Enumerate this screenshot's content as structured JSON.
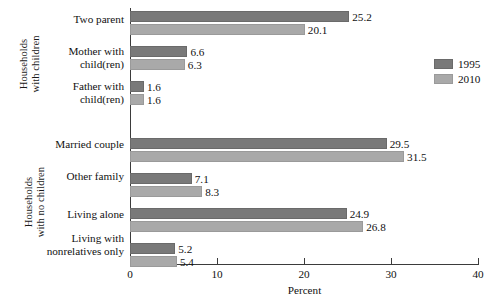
{
  "chart_data": {
    "type": "bar",
    "orientation": "horizontal",
    "title": "",
    "xlabel": "Percent",
    "ylabel": "",
    "xlim": [
      0,
      40
    ],
    "xticks": [
      0,
      10,
      20,
      30,
      40
    ],
    "xtick_labels": [
      "0",
      "10",
      "20",
      "30",
      "40"
    ],
    "grid": false,
    "legend_position": "right",
    "series": [
      {
        "name": "1995",
        "color": "#797979",
        "values": [
          25.2,
          6.6,
          1.6,
          29.5,
          7.1,
          24.9,
          5.2
        ]
      },
      {
        "name": "2010",
        "color": "#a9a9a9",
        "values": [
          20.1,
          6.3,
          1.6,
          31.5,
          8.3,
          26.8,
          5.4
        ]
      }
    ],
    "categories": [
      "Two parent",
      "Mother with child(ren)",
      "Father with child(ren)",
      "Married couple",
      "Other family",
      "Living alone",
      "Living with nonrelatives only"
    ],
    "category_lines": [
      [
        "Two parent"
      ],
      [
        "Mother with",
        "child(ren)"
      ],
      [
        "Father with",
        "child(ren)"
      ],
      [
        "Married couple"
      ],
      [
        "Other family"
      ],
      [
        "Living alone"
      ],
      [
        "Living with",
        "nonrelatives only"
      ]
    ],
    "groups": [
      {
        "label_lines": [
          "Households",
          "with children"
        ],
        "category_indices": [
          0,
          1,
          2
        ]
      },
      {
        "label_lines": [
          "Households",
          "with no children"
        ],
        "category_indices": [
          3,
          4,
          5,
          6
        ]
      }
    ],
    "value_labels": {
      "1995": [
        "25.2",
        "6.6",
        "1.6",
        "29.5",
        "7.1",
        "24.9",
        "5.2"
      ],
      "2010": [
        "20.1",
        "6.3",
        "1.6",
        "31.5",
        "8.3",
        "26.8",
        "5.4"
      ]
    }
  },
  "legend": {
    "items": [
      {
        "label": "1995",
        "series": "s1995"
      },
      {
        "label": "2010",
        "series": "s2010"
      }
    ]
  },
  "axis": {
    "x_title": "Percent"
  }
}
